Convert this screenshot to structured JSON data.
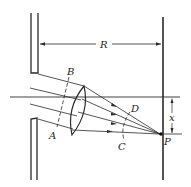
{
  "diagram": {
    "type": "optics-schematic",
    "labels": {
      "R": "R",
      "A": "A",
      "B": "B",
      "C": "C",
      "D": "D",
      "P": "P",
      "x": "x"
    },
    "elements": [
      "slit-plate-upper",
      "slit-plate-lower",
      "screen",
      "lens",
      "optical-axis",
      "incident-rays",
      "wavefront-AB",
      "wavefront-CD",
      "distance-R",
      "displacement-x",
      "focal-point-P"
    ]
  }
}
